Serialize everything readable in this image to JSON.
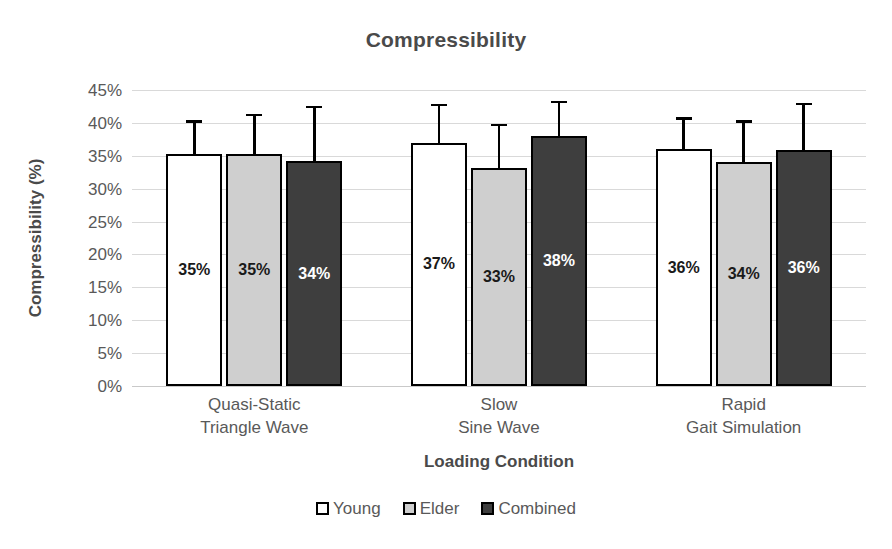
{
  "chart_data": {
    "type": "bar",
    "title": "Compressibility",
    "xlabel": "Loading Condition",
    "ylabel": "Compressibility (%)",
    "categories": [
      "Quasi-Static\nTriangle Wave",
      "Slow\nSine Wave",
      "Rapid\nGait Simulation"
    ],
    "category_lines": [
      [
        "Quasi-Static",
        "Triangle Wave"
      ],
      [
        "Slow",
        "Sine Wave"
      ],
      [
        "Rapid",
        "Gait Simulation"
      ]
    ],
    "ylim": [
      0,
      45
    ],
    "ytick_values": [
      45,
      40,
      35,
      30,
      25,
      20,
      15,
      10,
      5,
      0
    ],
    "ytick_labels": [
      "45%",
      "40%",
      "35%",
      "30%",
      "25%",
      "20%",
      "15%",
      "10%",
      "5%",
      "0%"
    ],
    "grid": true,
    "legend_position": "bottom",
    "series": [
      {
        "name": "Young",
        "color": "#ffffff",
        "values": [
          35.2,
          37.0,
          36.0
        ],
        "labels": [
          "35%",
          "37%",
          "36%"
        ],
        "errors_upper": [
          40.0,
          42.5,
          40.5
        ]
      },
      {
        "name": "Elder",
        "color": "#cfcfcf",
        "values": [
          35.3,
          33.2,
          34.1
        ],
        "labels": [
          "35%",
          "33%",
          "34%"
        ],
        "errors_upper": [
          41.0,
          39.5,
          40.0
        ]
      },
      {
        "name": "Combined",
        "color": "#3e3e3e",
        "values": [
          34.2,
          38.0,
          35.9
        ],
        "labels": [
          "34%",
          "38%",
          "36%"
        ],
        "errors_upper": [
          42.2,
          43.0,
          42.7
        ]
      }
    ]
  },
  "legend": {
    "items": [
      {
        "label": "Young",
        "swatch": "young"
      },
      {
        "label": "Elder",
        "swatch": "elder"
      },
      {
        "label": "Combined",
        "swatch": "combined"
      }
    ]
  }
}
